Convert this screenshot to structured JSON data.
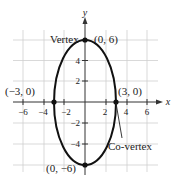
{
  "figure": {
    "axes": {
      "x_label": "x",
      "y_label": "y"
    },
    "x_ticks": [
      "−6",
      "−4",
      "−2",
      "2",
      "4",
      "6"
    ],
    "y_ticks": [
      "4",
      "2",
      "−2",
      "−4"
    ],
    "labels": {
      "vertex": "Vertex",
      "vertex_top": "(0, 6)",
      "vertex_bottom": "(0, −6)",
      "covertex_left": "(−3, 0)",
      "covertex_right": "(3, 0)",
      "covertex": "Co-vertex"
    },
    "ellipse": {
      "center": [
        0,
        0
      ],
      "a": 6,
      "b": 3,
      "orientation": "vertical"
    },
    "colors": {
      "grid": "#c8c8c8",
      "curve": "#111111",
      "axis": "#333333"
    }
  }
}
